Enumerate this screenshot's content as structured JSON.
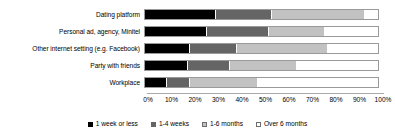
{
  "chart_data": {
    "type": "bar",
    "orientation": "horizontal",
    "stacked": true,
    "normalized": true,
    "title": "",
    "xlabel": "",
    "ylabel": "",
    "xlim": [
      0,
      100
    ],
    "xticks": [
      "0%",
      "10%",
      "20%",
      "30%",
      "40%",
      "50%",
      "60%",
      "70%",
      "80%",
      "90%",
      "100%"
    ],
    "grid": false,
    "legend_position": "bottom",
    "categories": [
      "Dating platform",
      "Personal ad, agency, Minitel",
      "Other internet setting (e.g. Facebook)",
      "Party with friends",
      "Workplace"
    ],
    "series": [
      {
        "name": "1 week or less",
        "color": "#000000",
        "values": [
          30,
          26,
          19,
          18,
          9
        ]
      },
      {
        "name": "1-4 weeks",
        "color": "#656565",
        "values": [
          24,
          27,
          20,
          18,
          10
        ]
      },
      {
        "name": "1-6 months",
        "color": "#c2c2c2",
        "values": [
          40,
          24,
          39,
          29,
          29
        ]
      },
      {
        "name": "Over 6 months",
        "color": "#ffffff",
        "values": [
          6,
          23,
          22,
          35,
          52
        ]
      }
    ]
  }
}
